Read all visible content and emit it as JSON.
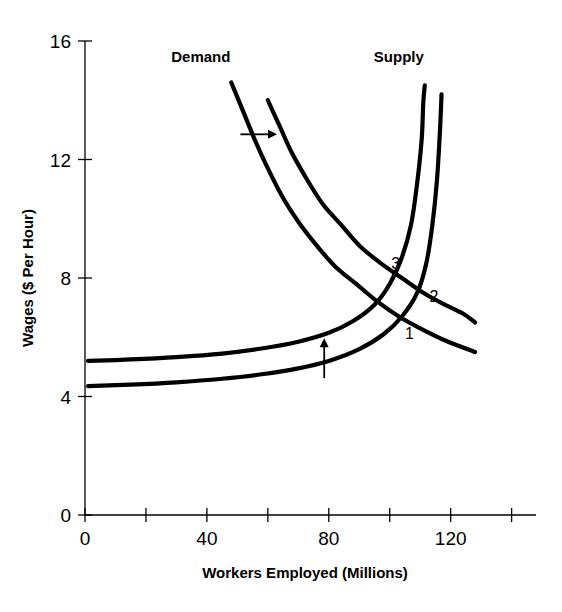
{
  "chart_data": {
    "type": "line",
    "title": "",
    "xlabel": "Workers Employed (Millions)",
    "ylabel": "Wages ($ Per Hour)",
    "xlim": [
      0,
      148
    ],
    "ylim": [
      0,
      16
    ],
    "xticks_labeled": [
      "0",
      "40",
      "80",
      "120"
    ],
    "xticks_labeled_values": [
      0,
      40,
      80,
      120
    ],
    "xticks_minor_values": [
      20,
      60,
      100,
      140
    ],
    "yticks_labeled": [
      "0",
      "4",
      "8",
      "12",
      "16"
    ],
    "yticks_labeled_values": [
      0,
      4,
      8,
      12,
      16
    ],
    "grid": false,
    "legend": "none",
    "series": [
      {
        "name": "Demand 1",
        "role": "demand-original",
        "points": [
          [
            48,
            14.6
          ],
          [
            52,
            13.6
          ],
          [
            56,
            12.6
          ],
          [
            60,
            11.7
          ],
          [
            65,
            10.7
          ],
          [
            70,
            9.9
          ],
          [
            76,
            9.1
          ],
          [
            82,
            8.4
          ],
          [
            89,
            7.8
          ],
          [
            96,
            7.2
          ],
          [
            103,
            6.7
          ],
          [
            110,
            6.3
          ],
          [
            118,
            5.9
          ],
          [
            128,
            5.5
          ]
        ]
      },
      {
        "name": "Demand 2",
        "role": "demand-shifted",
        "points": [
          [
            60,
            14.0
          ],
          [
            64,
            13.1
          ],
          [
            68,
            12.2
          ],
          [
            73,
            11.3
          ],
          [
            78,
            10.5
          ],
          [
            84,
            9.8
          ],
          [
            90,
            9.1
          ],
          [
            97,
            8.5
          ],
          [
            104,
            8.0
          ],
          [
            111,
            7.5
          ],
          [
            118,
            7.1
          ],
          [
            124,
            6.8
          ],
          [
            128,
            6.5
          ]
        ]
      },
      {
        "name": "Supply 1",
        "role": "supply-original",
        "points": [
          [
            1,
            4.35
          ],
          [
            15,
            4.4
          ],
          [
            30,
            4.48
          ],
          [
            45,
            4.6
          ],
          [
            58,
            4.75
          ],
          [
            70,
            4.95
          ],
          [
            80,
            5.2
          ],
          [
            90,
            5.6
          ],
          [
            98,
            6.1
          ],
          [
            104,
            6.7
          ],
          [
            109,
            7.5
          ],
          [
            112,
            8.5
          ],
          [
            114,
            9.8
          ],
          [
            115.5,
            11.3
          ],
          [
            116.5,
            13.0
          ],
          [
            117,
            14.2
          ]
        ]
      },
      {
        "name": "Supply 2",
        "role": "supply-shifted",
        "points": [
          [
            1,
            5.2
          ],
          [
            15,
            5.25
          ],
          [
            30,
            5.33
          ],
          [
            45,
            5.45
          ],
          [
            58,
            5.62
          ],
          [
            70,
            5.85
          ],
          [
            80,
            6.15
          ],
          [
            88,
            6.55
          ],
          [
            95,
            7.1
          ],
          [
            100,
            7.8
          ],
          [
            104,
            8.7
          ],
          [
            107,
            9.8
          ],
          [
            109,
            11.2
          ],
          [
            110.5,
            12.7
          ],
          [
            111,
            13.9
          ],
          [
            111.5,
            14.5
          ]
        ]
      }
    ],
    "curve_labels": [
      {
        "text": "Demand",
        "x": 38,
        "y": 15.3
      },
      {
        "text": "Supply",
        "x": 103,
        "y": 15.3
      }
    ],
    "point_labels": [
      {
        "text": "1",
        "x": 106.5,
        "y": 5.95,
        "note": "equilibrium original"
      },
      {
        "text": "2",
        "x": 114.5,
        "y": 7.2,
        "note": "equilibrium after both shifts"
      },
      {
        "text": "3",
        "x": 102,
        "y": 8.3,
        "note": "equilibrium intermediate"
      }
    ],
    "annotations": [
      {
        "type": "arrow-right",
        "label": "demand shift right",
        "x1": 51,
        "y1": 12.85,
        "x2": 63,
        "y2": 12.85
      },
      {
        "type": "arrow-up",
        "label": "supply shift up",
        "x1": 78.5,
        "y1": 4.62,
        "x2": 78.5,
        "y2": 5.97
      }
    ]
  },
  "axes": {
    "y_title": "Wages ($ Per Hour)",
    "x_title": "Workers Employed (Millions)",
    "y_tick_labels": [
      "16",
      "12",
      "8",
      "4",
      "0"
    ],
    "x_tick_labels": [
      "0",
      "40",
      "80",
      "120"
    ]
  }
}
